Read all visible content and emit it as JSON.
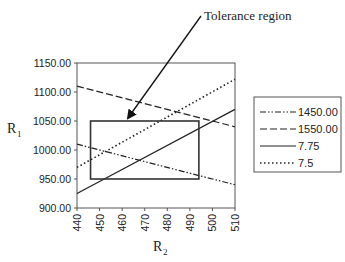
{
  "chart_data": {
    "type": "line",
    "title": "",
    "xlabel": "R2",
    "ylabel": "R1",
    "xlim": [
      440,
      510
    ],
    "ylim": [
      900,
      1150
    ],
    "x_ticks": [
      440,
      450,
      460,
      470,
      480,
      490,
      500,
      510
    ],
    "y_ticks": [
      "900.00",
      "950.00",
      "1000.00",
      "1050.00",
      "1100.00",
      "1150.00"
    ],
    "grid": false,
    "legend_position": "right",
    "series": [
      {
        "name": "1450.00",
        "style": "dash-dot-dot",
        "x": [
          440,
          510
        ],
        "y": [
          1010,
          940
        ]
      },
      {
        "name": "1550.00",
        "style": "dashed",
        "x": [
          440,
          510
        ],
        "y": [
          1110,
          1040
        ]
      },
      {
        "name": "7.75",
        "style": "solid",
        "x": [
          440,
          510
        ],
        "y": [
          925,
          1070
        ]
      },
      {
        "name": "7.5",
        "style": "dotted",
        "x": [
          440,
          510
        ],
        "y": [
          970,
          1122
        ]
      }
    ],
    "annotations": [
      {
        "text": "Tolerance region",
        "type": "arrow",
        "points_to": "rectangle"
      }
    ],
    "tolerance_region": {
      "x_min": 446,
      "x_max": 494,
      "y_min": 950,
      "y_max": 1050
    }
  },
  "labels": {
    "ylabel_main": "R",
    "ylabel_sub": "1",
    "xlabel_main": "R",
    "xlabel_sub": "2",
    "annotation": "Tolerance region"
  }
}
